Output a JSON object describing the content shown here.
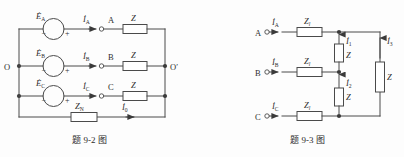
{
  "figure_left": {
    "caption_prefix": "题",
    "caption_number": "9-2",
    "caption_suffix": "图",
    "sources": [
      {
        "symbol": "E",
        "subscript": "A",
        "minus": "−",
        "plus": "+"
      },
      {
        "symbol": "E",
        "subscript": "B",
        "minus": "−",
        "plus": "+"
      },
      {
        "symbol": "E",
        "subscript": "C",
        "minus": "−",
        "plus": "+"
      }
    ],
    "currents": [
      {
        "symbol": "I",
        "subscript": "A"
      },
      {
        "symbol": "I",
        "subscript": "B"
      },
      {
        "symbol": "I",
        "subscript": "C"
      }
    ],
    "terminals": [
      {
        "label": "A"
      },
      {
        "label": "B"
      },
      {
        "label": "C"
      }
    ],
    "loads": [
      {
        "symbol": "Z"
      },
      {
        "symbol": "Z"
      },
      {
        "symbol": "Z"
      }
    ],
    "neutral_impedance": {
      "symbol": "Z",
      "subscript": "N"
    },
    "neutral_current": {
      "symbol": "I",
      "subscript": "0"
    },
    "node_left": "O",
    "node_right": "O′"
  },
  "figure_right": {
    "caption_prefix": "题",
    "caption_number": "9-3",
    "caption_suffix": "图",
    "terminals": [
      {
        "label": "A"
      },
      {
        "label": "B"
      },
      {
        "label": "C"
      }
    ],
    "line_currents": [
      {
        "symbol": "I",
        "subscript": "A"
      },
      {
        "symbol": "I",
        "subscript": "B"
      },
      {
        "symbol": "I",
        "subscript": "C"
      }
    ],
    "line_impedances": [
      {
        "symbol": "Z",
        "subscript": "l"
      },
      {
        "symbol": "Z",
        "subscript": "l"
      },
      {
        "symbol": "Z",
        "subscript": "l"
      }
    ],
    "branch_currents": [
      {
        "symbol": "I",
        "subscript": "1"
      },
      {
        "symbol": "I",
        "subscript": "2"
      },
      {
        "symbol": "I",
        "subscript": "3"
      }
    ],
    "branch_impedances": [
      {
        "symbol": "Z"
      },
      {
        "symbol": "Z"
      },
      {
        "symbol": "Z"
      }
    ]
  },
  "colors": {
    "wire": "#4a4a4a",
    "text": "#2e2e2e",
    "background": "#fdfdfd"
  }
}
